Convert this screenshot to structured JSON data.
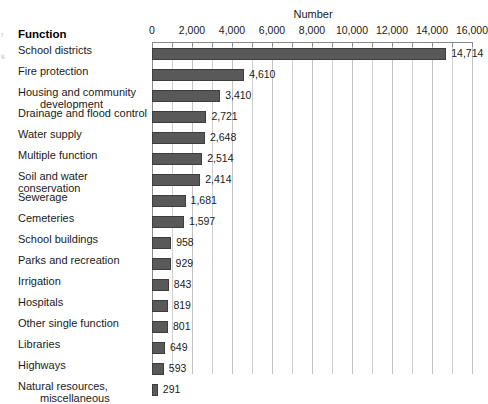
{
  "chart": {
    "type": "bar",
    "orientation": "horizontal",
    "axis_title": "Number",
    "category_header": "Function"
  },
  "edge_artifacts": {
    "mark1": "r",
    "mark2": "k"
  },
  "chart_data": {
    "type": "bar",
    "title": "",
    "subtitle": "",
    "xlabel": "Number",
    "ylabel": "Function",
    "orientation": "horizontal",
    "xlim": [
      0,
      16000
    ],
    "grid": true,
    "legend": "none",
    "tick_labels": [
      "0",
      "2,000",
      "4,000",
      "6,000",
      "8,000",
      "10,000",
      "12,000",
      "14,000",
      "16,000"
    ],
    "tick_values": [
      0,
      2000,
      4000,
      6000,
      8000,
      10000,
      12000,
      14000,
      16000
    ],
    "minor_tick_step": 1000,
    "categories": [
      "School districts",
      "Fire protection",
      "Housing and community development",
      "Drainage and flood control",
      "Water supply",
      "Multiple function",
      "Soil and water conservation",
      "Sewerage",
      "Cemeteries",
      "School buildings",
      "Parks and recreation",
      "Irrigation",
      "Hospitals",
      "Other single function",
      "Libraries",
      "Highways",
      "Natural resources, miscellaneous"
    ],
    "values": [
      14714,
      4610,
      3410,
      2721,
      2648,
      2514,
      2414,
      1681,
      1597,
      958,
      929,
      843,
      819,
      801,
      649,
      593,
      291
    ],
    "value_labels": [
      "14,714",
      "4,610",
      "3,410",
      "2,721",
      "2,648",
      "2,514",
      "2,414",
      "1,681",
      "1,597",
      "958",
      "929",
      "843",
      "819",
      "801",
      "649",
      "593",
      "291"
    ],
    "bar_color": "#595959",
    "bar_border_color": "#3d3d3d",
    "gridline_color": "#cfcfcf"
  },
  "rows": [
    {
      "label_line1": "School districts",
      "label_line2": "",
      "value_label": "14,714"
    },
    {
      "label_line1": "Fire protection",
      "label_line2": "",
      "value_label": "4,610"
    },
    {
      "label_line1": "Housing and community",
      "label_line2": "development",
      "value_label": "3,410"
    },
    {
      "label_line1": "Drainage and flood control",
      "label_line2": "",
      "value_label": "2,721"
    },
    {
      "label_line1": "Water supply",
      "label_line2": "",
      "value_label": "2,648"
    },
    {
      "label_line1": "Multiple function",
      "label_line2": "",
      "value_label": "2,514"
    },
    {
      "label_line1": "Soil and water conservation",
      "label_line2": "",
      "value_label": "2,414"
    },
    {
      "label_line1": "Sewerage",
      "label_line2": "",
      "value_label": "1,681"
    },
    {
      "label_line1": "Cemeteries",
      "label_line2": "",
      "value_label": "1,597"
    },
    {
      "label_line1": "School buildings",
      "label_line2": "",
      "value_label": "958"
    },
    {
      "label_line1": "Parks and recreation",
      "label_line2": "",
      "value_label": "929"
    },
    {
      "label_line1": "Irrigation",
      "label_line2": "",
      "value_label": "843"
    },
    {
      "label_line1": "Hospitals",
      "label_line2": "",
      "value_label": "819"
    },
    {
      "label_line1": "Other single function",
      "label_line2": "",
      "value_label": "801"
    },
    {
      "label_line1": "Libraries",
      "label_line2": "",
      "value_label": "649"
    },
    {
      "label_line1": "Highways",
      "label_line2": "",
      "value_label": "593"
    },
    {
      "label_line1": "Natural resources,",
      "label_line2": "miscellaneous",
      "value_label": "291"
    }
  ]
}
